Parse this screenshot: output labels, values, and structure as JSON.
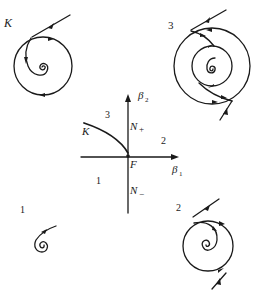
{
  "diagram": {
    "type": "bifurcation-diagram",
    "center": {
      "axes": {
        "horizontal_label": "β",
        "horizontal_sub": "1",
        "vertical_label": "β",
        "vertical_sub": "2"
      },
      "origin_label": "F",
      "curve_labels": {
        "n_plus": "N",
        "n_plus_sign": "+",
        "n_minus": "N",
        "n_minus_sign": "−",
        "k": "K"
      },
      "region_labels": [
        "1",
        "2",
        "3"
      ]
    },
    "portraits": [
      {
        "id": "K",
        "label": "K",
        "position": "top-left",
        "description": "spiral inside a closed orbit, incoming trajectory"
      },
      {
        "id": "3",
        "label": "3",
        "position": "top-right",
        "description": "spiral surrounded by two nested closed orbits"
      },
      {
        "id": "1",
        "label": "1",
        "position": "bottom-left",
        "description": "single stable spiral with incoming trajectory"
      },
      {
        "id": "2",
        "label": "2",
        "position": "bottom-right",
        "description": "spiral surrounded by one closed orbit"
      }
    ],
    "colors": {
      "ink": "#1a1a1a",
      "background": "#ffffff"
    }
  }
}
